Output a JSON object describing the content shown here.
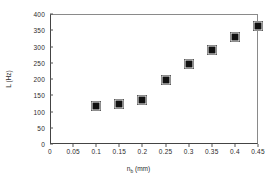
{
  "chart_data": {
    "type": "scatter",
    "title": "",
    "xlabel": "n_b (mm)",
    "xlabel_base": "n",
    "xlabel_sub": "b",
    "xlabel_unit": " (mm)",
    "ylabel": "L (Hz)",
    "xlim": [
      0,
      0.45
    ],
    "ylim": [
      0,
      400
    ],
    "grid": false,
    "legend": null,
    "marker_color": "#111111",
    "axis_color": "#444444",
    "x_ticks": [
      "0",
      "0.05",
      "0.1",
      "0.15",
      "0.2",
      "0.25",
      "0.3",
      "0.35",
      "0.4",
      "0.45"
    ],
    "x_tick_values": [
      0,
      0.05,
      0.1,
      0.15,
      0.2,
      0.25,
      0.3,
      0.35,
      0.4,
      0.45
    ],
    "y_ticks": [
      "0",
      "50",
      "100",
      "150",
      "200",
      "250",
      "300",
      "350",
      "400"
    ],
    "y_tick_values": [
      0,
      50,
      100,
      150,
      200,
      250,
      300,
      350,
      400
    ],
    "x": [
      0.1,
      0.15,
      0.2,
      0.25,
      0.3,
      0.35,
      0.4,
      0.45
    ],
    "values": [
      118,
      123,
      135,
      198,
      245,
      288,
      330,
      362
    ]
  }
}
